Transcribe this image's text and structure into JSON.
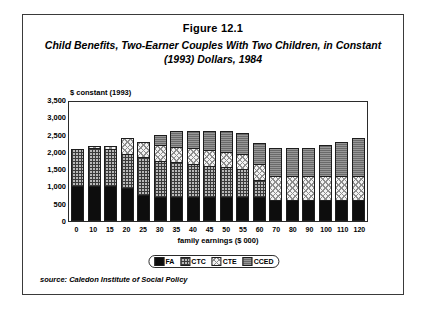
{
  "figure": {
    "number": "Figure 12.1",
    "title": "Child Benefits, Two-Earner Couples With Two Children, in Constant (1993) Dollars, 1984",
    "source": "source: Caledon Institute of Social Policy"
  },
  "chart_data": {
    "type": "bar",
    "stacked": true,
    "title": "Child Benefits, Two-Earner Couples With Two Children, in Constant (1993) Dollars, 1984",
    "subtitle": "Figure 12.1",
    "xlabel": "family earnings ($ 000)",
    "ylabel": "$ constant (1993)",
    "ylim": [
      0,
      3500
    ],
    "ytick_step": 500,
    "ytick_labels": [
      "3,500",
      "3,000",
      "2,500",
      "2,000",
      "1,500",
      "1,000",
      "500",
      "0"
    ],
    "grid": false,
    "legend_position": "bottom",
    "categories": [
      "0",
      "10",
      "15",
      "20",
      "25",
      "30",
      "35",
      "40",
      "45",
      "50",
      "55",
      "60",
      "70",
      "80",
      "90",
      "100",
      "110",
      "120"
    ],
    "series": [
      {
        "name": "FA",
        "swatch": "#0d0d0d",
        "values": [
          1000,
          1000,
          1000,
          950,
          750,
          700,
          700,
          700,
          700,
          700,
          700,
          700,
          600,
          600,
          600,
          600,
          600,
          600
        ]
      },
      {
        "name": "CTC",
        "swatch": "#b9b9b9",
        "values": [
          1080,
          1120,
          1080,
          1000,
          1100,
          1050,
          1000,
          950,
          900,
          850,
          800,
          500,
          0,
          0,
          0,
          0,
          0,
          0
        ]
      },
      {
        "name": "CTE",
        "swatch": "#f2f2f2",
        "values": [
          0,
          60,
          100,
          450,
          450,
          450,
          450,
          450,
          450,
          450,
          450,
          450,
          700,
          700,
          700,
          700,
          700,
          700
        ]
      },
      {
        "name": "CCED",
        "swatch": "#6a6a6a",
        "values": [
          0,
          0,
          0,
          0,
          0,
          300,
          450,
          500,
          550,
          600,
          600,
          600,
          800,
          800,
          800,
          900,
          1000,
          1100
        ]
      }
    ],
    "totals": [
      2080,
      2180,
      2180,
      2400,
      2300,
      2500,
      2600,
      2600,
      2600,
      2600,
      2550,
      2250,
      2100,
      2100,
      2100,
      2200,
      2300,
      2400
    ]
  }
}
